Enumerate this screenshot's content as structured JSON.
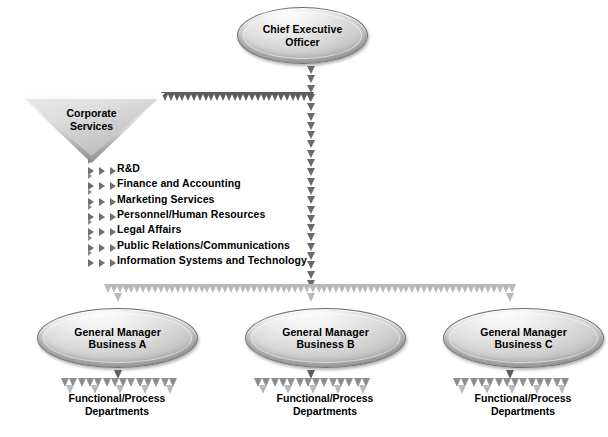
{
  "diagram": {
    "type": "org-chart",
    "background_color": "#ffffff",
    "shape_fill_light": "#f2f2f2",
    "shape_fill_dark": "#8b8b8b",
    "arrow_dark": "#5e5e5e",
    "arrow_mid": "#8e8e8e",
    "arrow_light": "#b9b9b9",
    "text_color": "#000000"
  },
  "ceo": {
    "line1": "Chief Executive",
    "line2": "Officer",
    "shape": "ellipse"
  },
  "corporate_services": {
    "line1": "Corporate",
    "line2": "Services",
    "shape": "inverted-triangle",
    "functions": [
      "R&D",
      "Finance and Accounting",
      "Marketing Services",
      "Personnel/Human Resources",
      "Legal Affairs",
      "Public Relations/Communications",
      "Information Systems and Technology"
    ]
  },
  "general_managers": [
    {
      "line1": "General Manager",
      "line2": "Business A",
      "dept_line1": "Functional/Process",
      "dept_line2": "Departments"
    },
    {
      "line1": "General Manager",
      "line2": "Business B",
      "dept_line1": "Functional/Process",
      "dept_line2": "Departments"
    },
    {
      "line1": "General Manager",
      "line2": "Business C",
      "dept_line1": "Functional/Process",
      "dept_line2": "Departments"
    }
  ]
}
